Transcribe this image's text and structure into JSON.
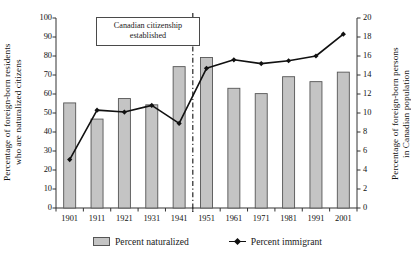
{
  "chart_data": {
    "type": "bar",
    "title": "",
    "categories": [
      "1901",
      "1911",
      "1921",
      "1931",
      "1941",
      "1951",
      "1961",
      "1971",
      "1981",
      "1991",
      "2001"
    ],
    "xlabel": "",
    "ylabel": "Percentage of foreign-born residents\nwho are naturalized citizens",
    "ylabel_right": "Percentage of foreign-born persons\nin Canadian population",
    "ylim": [
      0,
      100
    ],
    "ylim_right": [
      0,
      20
    ],
    "yticks": [
      0,
      10,
      20,
      30,
      40,
      50,
      60,
      70,
      80,
      90,
      100
    ],
    "yticks_right": [
      0,
      2,
      4,
      6,
      8,
      10,
      12,
      14,
      16,
      18,
      20
    ],
    "grid": false,
    "legend_position": "bottom",
    "series": [
      {
        "name": "Percent naturalized",
        "kind": "bar",
        "axis": "left",
        "color": "#c4c4c4",
        "edge_color": "#555555",
        "values": [
          55.3,
          46.8,
          57.6,
          54.3,
          74.4,
          79.2,
          63.0,
          60.2,
          69.1,
          66.5,
          71.5
        ]
      },
      {
        "name": "Percent immigrant",
        "kind": "line",
        "axis": "right",
        "color": "#111111",
        "marker": "diamond",
        "values": [
          5.1,
          10.3,
          10.1,
          10.8,
          8.9,
          14.7,
          15.6,
          15.2,
          15.5,
          16.0,
          18.3
        ]
      }
    ],
    "annotations": [
      {
        "text": "Canadian citizenship established",
        "text_lines": [
          "Canadian citizenship",
          "established"
        ],
        "points_to": "1946",
        "style": "boxed-with-arrow"
      }
    ],
    "reference_lines": [
      {
        "orientation": "vertical",
        "between": "1941-1951",
        "style": "dash-dot",
        "color": "#111111"
      }
    ]
  },
  "legend": {
    "items": [
      {
        "label": "Percent naturalized",
        "marker": "bar-swatch"
      },
      {
        "label": "Percent immigrant",
        "marker": "line-diamond"
      }
    ]
  },
  "axes": {
    "left_title": "Percentage of foreign-born residents\nwho are naturalized citizens",
    "right_title": "Percentage of foreign-born persons\nin Canadian population"
  }
}
